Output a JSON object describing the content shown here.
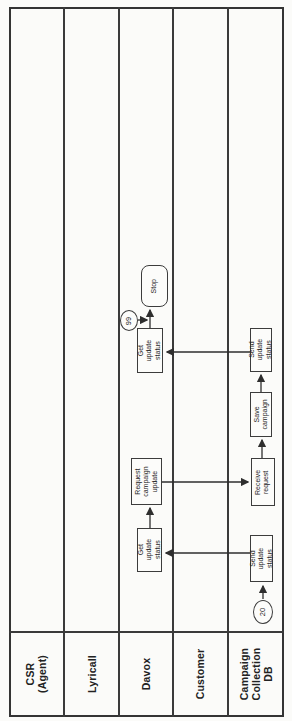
{
  "diagram": {
    "type": "swimlane-flowchart",
    "orientation": "rotated-90-ccw",
    "colors": {
      "line": "#3a3a3a",
      "background": "#fbfbf9",
      "node_bg": "#fcfcfa",
      "text": "#242424"
    }
  },
  "lanes": [
    {
      "id": "csr-agent",
      "label": "CSR\n(Agent)"
    },
    {
      "id": "lyricall",
      "label": "Lyricall"
    },
    {
      "id": "davox",
      "label": "Davox"
    },
    {
      "id": "customer",
      "label": "Customer"
    },
    {
      "id": "campaign-collection-db",
      "label": "Campaign\nCollection DB"
    }
  ],
  "nodes": {
    "stop": {
      "label": "Stop",
      "type": "terminator",
      "lane": "Davox"
    },
    "get_update_status_1": {
      "label": "Get update\nstatus",
      "type": "process",
      "lane": "Davox"
    },
    "request_campaign_update": {
      "label": "Request\ncampaign\nupdate",
      "type": "process",
      "lane": "Davox"
    },
    "get_update_status_2": {
      "label": "Get update\nstatus",
      "type": "process",
      "lane": "Davox"
    },
    "send_update_status_1": {
      "label": "Send update\nstatus",
      "type": "process",
      "lane": "Campaign Collection DB"
    },
    "save_campaign": {
      "label": "Save\ncampaign",
      "type": "process",
      "lane": "Campaign Collection DB"
    },
    "receive_request": {
      "label": "Receive\nrequest",
      "type": "process",
      "lane": "Campaign Collection DB"
    },
    "send_update_status_2": {
      "label": "Send update\nstatus",
      "type": "process",
      "lane": "Campaign Collection DB"
    }
  },
  "badges": {
    "connector_99": "99",
    "connector_20": "20"
  },
  "flow_order": [
    "connector 20 -> Send update status (DB)",
    "Send update status (DB) -> Get update status (Davox)",
    "Get update status (Davox) -> Request campaign update (Davox)",
    "Request campaign update (Davox) -> Receive request (DB)",
    "Receive request (DB) -> Save campaign (DB)",
    "Save campaign (DB) -> Send update status (DB)",
    "Send update status (DB) -> Get update status (Davox)",
    "connector 99 joins -> Stop (Davox)"
  ]
}
